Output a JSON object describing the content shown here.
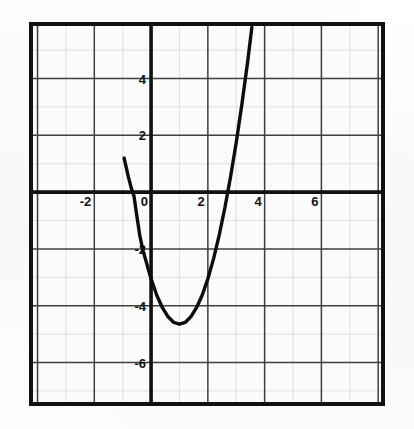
{
  "figure": {
    "background_color": "#fdfdfd",
    "ink_color": "#111111",
    "grid_color": "#4a4a4a",
    "border_color": "#111111"
  },
  "chart_data": {
    "type": "line",
    "title": "",
    "subtitle": "",
    "xlabel": "",
    "ylabel": "",
    "grid": true,
    "legend": "none",
    "xlim": [
      -4.23,
      8.17
    ],
    "ylim": [
      -7.46,
      5.92
    ],
    "x_major_step": 2,
    "y_major_step": 2,
    "x_minor_step": 1,
    "y_minor_step": 1,
    "x_tick_labels": [
      "-2",
      "0",
      "2",
      "4",
      "6"
    ],
    "x_tick_values": [
      -2,
      0,
      2,
      4,
      6
    ],
    "y_tick_labels": [
      "4",
      "2",
      "-2",
      "-4",
      "-6"
    ],
    "y_tick_values": [
      4,
      2,
      -2,
      -4,
      -6
    ],
    "origin_label": "0",
    "curve": {
      "name": "parabola",
      "equation": "y = 1.6(x - 1)^2 - 4.65",
      "leading_coefficient": 1.6,
      "vertex": [
        1,
        -4.65
      ],
      "roots": [
        -0.7,
        2.7
      ],
      "y_intercept": -3.05,
      "opens": "up",
      "stroke_color": "#0d0d0d",
      "stroke_width": 3.4,
      "points": [
        [
          -0.95,
          1.2
        ],
        [
          -0.8,
          0.54
        ],
        [
          -0.7,
          0.15
        ],
        [
          -0.6,
          -0.15
        ],
        [
          -0.5,
          -0.85
        ],
        [
          -0.4,
          -1.51
        ],
        [
          -0.3,
          -2.0
        ],
        [
          -0.2,
          -2.35
        ],
        [
          -0.1,
          -2.71
        ],
        [
          0.0,
          -3.05
        ],
        [
          0.2,
          -3.63
        ],
        [
          0.4,
          -4.07
        ],
        [
          0.6,
          -4.39
        ],
        [
          0.8,
          -4.59
        ],
        [
          1.0,
          -4.65
        ],
        [
          1.2,
          -4.59
        ],
        [
          1.4,
          -4.39
        ],
        [
          1.6,
          -4.07
        ],
        [
          1.8,
          -3.63
        ],
        [
          2.0,
          -3.05
        ],
        [
          2.2,
          -2.35
        ],
        [
          2.4,
          -1.51
        ],
        [
          2.6,
          -0.55
        ],
        [
          2.8,
          0.54
        ],
        [
          3.0,
          1.75
        ],
        [
          3.2,
          3.1
        ],
        [
          3.4,
          4.57
        ],
        [
          3.55,
          5.8
        ]
      ]
    }
  }
}
